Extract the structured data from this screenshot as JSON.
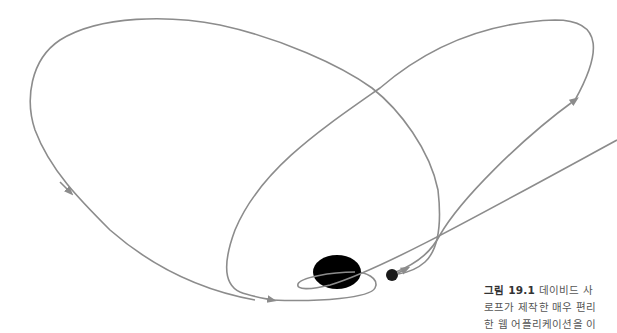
{
  "figure": {
    "label": "그림 19.1",
    "caption_lines": [
      "데이비드 사",
      "로프가 제작한 매우 편리",
      "한 웹 어플리케이션을 이"
    ]
  },
  "diagram": {
    "line_color": "#8c8c8c",
    "planet_color": "#000000",
    "moon_color": "#1a1a1a",
    "planet": {
      "cx": 337,
      "cy": 272,
      "rx": 24,
      "ry": 17
    },
    "moon": {
      "cx": 392,
      "cy": 275,
      "r": 6
    }
  }
}
